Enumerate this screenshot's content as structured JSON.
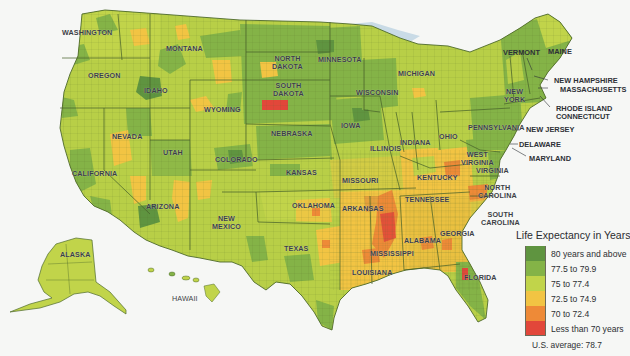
{
  "map": {
    "title": "Life Expectancy in Years",
    "region": "United States (by county)",
    "us_average_label": "U.S. average:",
    "us_average_value": "78.7",
    "us_average_text": "U.S. average:  78.7",
    "legend": [
      {
        "label": "80 years and above",
        "color": "#5f9440"
      },
      {
        "label": "77.5 to 79.9",
        "color": "#84b347"
      },
      {
        "label": "75 to 77.4",
        "color": "#c1d44a"
      },
      {
        "label": "72.5 to 74.9",
        "color": "#f2c443"
      },
      {
        "label": "70 to 72.4",
        "color": "#ee8a37"
      },
      {
        "label": "Less than 70 years",
        "color": "#e2473a"
      }
    ],
    "colors": {
      "background": "#f6f7f5",
      "water": "#c9dbe6",
      "border": "#4e6a2c",
      "label_text": "#3c3f45"
    },
    "state_labels": [
      {
        "name": "Washington",
        "x": 92,
        "y": 33
      },
      {
        "name": "Montana",
        "x": 192,
        "y": 45
      },
      {
        "name": "Oregon",
        "x": 88,
        "y": 70
      },
      {
        "name": "Idaho",
        "x": 146,
        "y": 85
      },
      {
        "name": "Wyoming",
        "x": 205,
        "y": 105
      },
      {
        "name": "North\nDakota",
        "x": 262,
        "y": 56
      },
      {
        "name": "South\nDakota",
        "x": 263,
        "y": 87
      },
      {
        "name": "Minnesota",
        "x": 340,
        "y": 56
      },
      {
        "name": "Wisconsin",
        "x": 378,
        "y": 90
      },
      {
        "name": "Michigan",
        "x": 413,
        "y": 70
      },
      {
        "name": "Nebraska",
        "x": 289,
        "y": 133
      },
      {
        "name": "Iowa",
        "x": 349,
        "y": 123
      },
      {
        "name": "Illinois",
        "x": 381,
        "y": 148
      },
      {
        "name": "Indiana",
        "x": 413,
        "y": 140
      },
      {
        "name": "Ohio",
        "x": 446,
        "y": 135
      },
      {
        "name": "Pennsylvania",
        "x": 477,
        "y": 124
      },
      {
        "name": "New\nYork",
        "x": 512,
        "y": 93
      },
      {
        "name": "Nevada",
        "x": 124,
        "y": 135
      },
      {
        "name": "Utah",
        "x": 174,
        "y": 151
      },
      {
        "name": "Colorado",
        "x": 233,
        "y": 157
      },
      {
        "name": "Kansas",
        "x": 292,
        "y": 170
      },
      {
        "name": "Missouri",
        "x": 355,
        "y": 179
      },
      {
        "name": "Kentucky",
        "x": 435,
        "y": 176
      },
      {
        "name": "West\nVirginia",
        "x": 468,
        "y": 157
      },
      {
        "name": "Virginia",
        "x": 484,
        "y": 169
      },
      {
        "name": "California",
        "x": 90,
        "y": 171
      },
      {
        "name": "Arizona",
        "x": 162,
        "y": 204
      },
      {
        "name": "New\nMexico",
        "x": 223,
        "y": 222
      },
      {
        "name": "Oklahoma",
        "x": 310,
        "y": 204
      },
      {
        "name": "Arkansas",
        "x": 361,
        "y": 207
      },
      {
        "name": "Tennessee",
        "x": 423,
        "y": 198
      },
      {
        "name": "North\nCarolina",
        "x": 489,
        "y": 190
      },
      {
        "name": "South\nCarolina",
        "x": 494,
        "y": 217
      },
      {
        "name": "Georgia",
        "x": 452,
        "y": 231
      },
      {
        "name": "Alabama",
        "x": 416,
        "y": 239
      },
      {
        "name": "Mississippi",
        "x": 386,
        "y": 251
      },
      {
        "name": "Texas",
        "x": 292,
        "y": 247
      },
      {
        "name": "Louisiana",
        "x": 372,
        "y": 271
      },
      {
        "name": "Florida",
        "x": 472,
        "y": 275
      },
      {
        "name": "Alaska",
        "x": 74,
        "y": 254
      },
      {
        "name": "Hawaii",
        "x": 182,
        "y": 295
      }
    ],
    "callout_labels": [
      {
        "name": "VERMONT",
        "x": 503,
        "y": 52
      },
      {
        "name": "MAINE",
        "x": 550,
        "y": 50
      },
      {
        "name": "NEW HAMPSHIRE",
        "x": 555,
        "y": 77
      },
      {
        "name": "MASSACHUSETTS",
        "x": 561,
        "y": 86
      },
      {
        "name": "RHODE ISLAND",
        "x": 557,
        "y": 105
      },
      {
        "name": "CONNECTICUT",
        "x": 557,
        "y": 113
      },
      {
        "name": "NEW JERSEY",
        "x": 527,
        "y": 126
      },
      {
        "name": "DELAWARE",
        "x": 520,
        "y": 141
      },
      {
        "name": "MARYLAND",
        "x": 529,
        "y": 155
      }
    ]
  }
}
